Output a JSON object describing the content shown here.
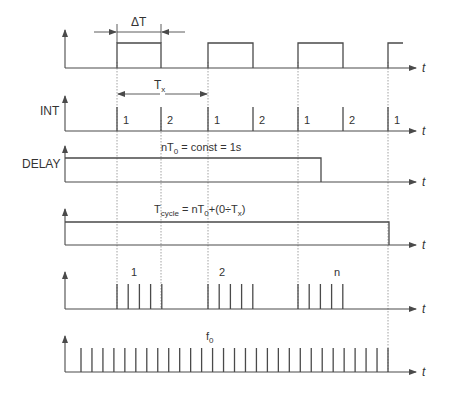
{
  "diagram": {
    "type": "timing-diagram",
    "time_axis_label": "t",
    "annotations": {
      "delta_t": "ΔT",
      "tx_base": "T",
      "tx_sub": "x",
      "delay_formula_pre": "nT",
      "delay_formula_sub": "0",
      "delay_formula_post": " = const = 1s",
      "cycle_T": "T",
      "cycle_sub": "cycle",
      "cycle_mid": " = nT",
      "cycle_sub0": "0",
      "cycle_post": "+(0÷T",
      "cycle_sub_x": "x",
      "cycle_close": ")",
      "f0_base": "f",
      "f0_sub": "0"
    },
    "signals": [
      {
        "id": "trigger",
        "label": "",
        "description": "square pulse train of width ΔT and period Tx"
      },
      {
        "id": "int",
        "label": "INT",
        "phase_labels": [
          "1",
          "2",
          "1",
          "2",
          "1",
          "2",
          "1"
        ]
      },
      {
        "id": "delay",
        "label": "DELAY",
        "description": "high for nT0 = 1s"
      },
      {
        "id": "cycle",
        "label": "",
        "description": "high for Tcycle = nT0 + (0÷Tx)"
      },
      {
        "id": "bursts",
        "label": "",
        "burst_labels": [
          "1",
          "2",
          "n"
        ],
        "pulses_per_burst": 5
      },
      {
        "id": "clock",
        "label": "",
        "description": "continuous clock at f0",
        "pulse_count": 29
      }
    ]
  }
}
